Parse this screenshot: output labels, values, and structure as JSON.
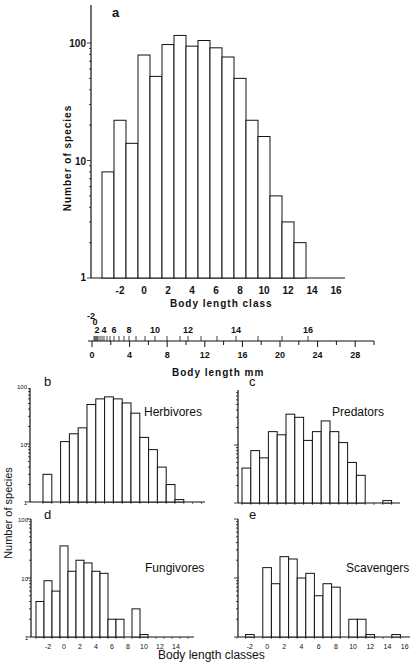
{
  "chart_data": [
    {
      "panel": "a",
      "type": "bar",
      "title": "",
      "panel_label": "a",
      "xlabel": "Body length class",
      "ylabel": "Number of species",
      "yscale": "log",
      "ylim": [
        1,
        180
      ],
      "y_ticks": [
        1,
        10,
        100
      ],
      "x_ticks": [
        -2,
        0,
        2,
        4,
        6,
        8,
        10,
        12,
        14,
        16
      ],
      "categories": [
        -3,
        -2,
        -1,
        0,
        1,
        2,
        3,
        4,
        5,
        6,
        7,
        8,
        9,
        10,
        11,
        12,
        13
      ],
      "values": [
        8,
        22,
        14,
        79,
        52,
        97,
        116,
        94,
        105,
        91,
        76,
        50,
        22,
        16,
        5,
        3,
        2
      ]
    },
    {
      "panel": "b",
      "type": "bar",
      "panel_label": "b",
      "label": "Herbivores",
      "yscale": "log",
      "y_ticks": [
        1,
        10,
        100
      ],
      "categories": [
        -3,
        -1,
        0,
        1,
        2,
        3,
        4,
        5,
        6,
        7,
        8,
        9,
        10,
        11,
        12
      ],
      "values": [
        3,
        11,
        15,
        19,
        48,
        60,
        65,
        60,
        51,
        34,
        13,
        8,
        4,
        2,
        1.1
      ]
    },
    {
      "panel": "c",
      "type": "bar",
      "panel_label": "c",
      "label": "Predators",
      "yscale": "log",
      "categories": [
        -3,
        -2,
        -1,
        0,
        1,
        2,
        3,
        4,
        5,
        6,
        7,
        8,
        9,
        10,
        13
      ],
      "values": [
        4,
        8,
        6,
        17,
        15,
        34,
        30,
        12,
        17,
        26,
        17,
        11,
        5,
        3,
        1.1
      ]
    },
    {
      "panel": "d",
      "type": "bar",
      "panel_label": "d",
      "label": "Fungivores",
      "yscale": "log",
      "y_ticks": [
        1,
        10,
        100
      ],
      "x_ticks": [
        -2,
        0,
        2,
        4,
        6,
        8,
        10,
        12,
        14
      ],
      "categories": [
        -3,
        -2,
        -1,
        0,
        1,
        2,
        3,
        4,
        5,
        6,
        7,
        9,
        10
      ],
      "values": [
        4,
        9,
        6,
        35,
        13,
        20,
        18,
        13,
        12,
        2,
        2,
        3,
        1.1
      ]
    },
    {
      "panel": "e",
      "type": "bar",
      "panel_label": "e",
      "label": "Scavengers",
      "yscale": "log",
      "x_ticks": [
        -2,
        0,
        2,
        4,
        6,
        8,
        10,
        12,
        14,
        16
      ],
      "categories": [
        -2,
        0,
        1,
        2,
        3,
        4,
        5,
        6,
        7,
        8,
        10,
        11,
        12,
        15
      ],
      "values": [
        1.1,
        15,
        8,
        23,
        21,
        10,
        12,
        5,
        8,
        7,
        2,
        2,
        1.1,
        1.1
      ]
    }
  ],
  "mm_scale": {
    "label": "Body length mm",
    "mm_ticks": [
      0,
      4,
      8,
      12,
      16,
      20,
      24,
      28
    ],
    "class_labels": [
      "-2",
      "0",
      "2",
      "4",
      "6",
      "8",
      "10",
      "12",
      "14",
      "16"
    ]
  },
  "labels": {
    "panel_a_xlabel": "Body length class",
    "panel_a_ylabel": "Number of species",
    "bottom_ylabel": "Number of species",
    "bottom_xlabel": "Body length classes",
    "herbivores": "Herbivores",
    "predators": "Predators",
    "fungivores": "Fungivores",
    "scavengers": "Scavengers",
    "a": "a",
    "b": "b",
    "c": "c",
    "d": "d",
    "e": "e",
    "y100": "100",
    "y10": "10",
    "y1": "1"
  }
}
